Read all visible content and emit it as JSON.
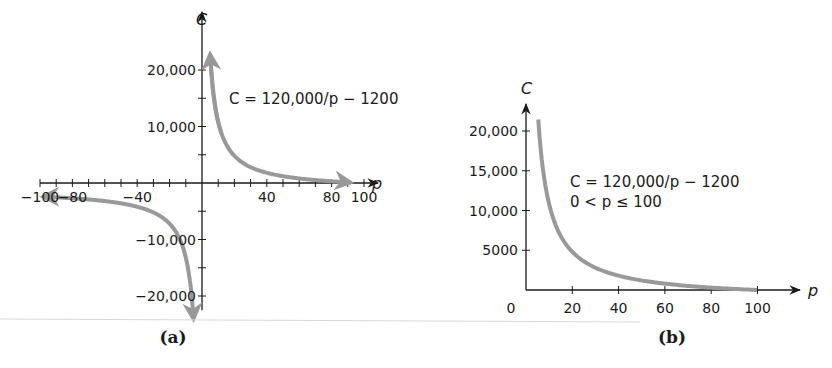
{
  "chart_data": [
    {
      "id": "a",
      "type": "line",
      "caption": "(a)",
      "title": "",
      "equation_label": "C = 120,000/p − 1200",
      "xlabel": "p",
      "ylabel": "C",
      "xlim": [
        -100,
        100
      ],
      "ylim": [
        -20000,
        20000
      ],
      "x_tick_labels": [
        "−100",
        "−80",
        "−40",
        "40",
        "80",
        "100"
      ],
      "x_tick_values": [
        -100,
        -80,
        -40,
        40,
        80,
        100
      ],
      "x_minor_ticks": [
        -100,
        -90,
        -80,
        -70,
        -60,
        -50,
        -40,
        -30,
        -20,
        -10,
        10,
        20,
        30,
        40,
        50,
        60,
        70,
        80,
        90,
        100
      ],
      "y_tick_labels": [
        "20,000",
        "10,000",
        "−10,000",
        "−20,000"
      ],
      "y_tick_values": [
        20000,
        10000,
        -10000,
        -20000
      ],
      "y_minor_ticks": [
        20000,
        15000,
        10000,
        5000,
        -5000,
        -10000,
        -15000,
        -20000
      ],
      "grid": false,
      "series": [
        {
          "name": "C = 120,000/p − 1200 (p > 0)",
          "color": "#999999",
          "x": [
            5,
            6,
            8,
            10,
            15,
            20,
            30,
            40,
            60,
            80,
            100
          ],
          "values": [
            22800,
            18800,
            13800,
            10800,
            6800,
            4800,
            2800,
            1800,
            800,
            300,
            0
          ]
        },
        {
          "name": "C = 120,000/p − 1200 (p < 0)",
          "color": "#999999",
          "x": [
            -100,
            -80,
            -60,
            -40,
            -30,
            -20,
            -15,
            -10,
            -8,
            -6,
            -5
          ],
          "values": [
            -2400,
            -2700,
            -3200,
            -4200,
            -5200,
            -7200,
            -9200,
            -13200,
            -16200,
            -21200,
            -25200
          ]
        }
      ]
    },
    {
      "id": "b",
      "type": "line",
      "caption": "(b)",
      "title": "",
      "equation_label": "C = 120,000/p − 1200",
      "domain_label": "0 < p ≤ 100",
      "xlabel": "p",
      "ylabel": "C",
      "xlim": [
        0,
        100
      ],
      "ylim": [
        0,
        20000
      ],
      "x_tick_labels": [
        "0",
        "20",
        "40",
        "60",
        "80",
        "100"
      ],
      "x_tick_values": [
        0,
        20,
        40,
        60,
        80,
        100
      ],
      "y_tick_labels": [
        "20,000",
        "15,000",
        "10,000",
        "5000"
      ],
      "y_tick_values": [
        20000,
        15000,
        10000,
        5000
      ],
      "grid": false,
      "series": [
        {
          "name": "C = 120,000/p − 1200",
          "color": "#999999",
          "x": [
            5.3,
            6,
            8,
            10,
            15,
            20,
            30,
            40,
            60,
            80,
            100
          ],
          "values": [
            21400,
            18800,
            13800,
            10800,
            6800,
            4800,
            2800,
            1800,
            800,
            300,
            0
          ]
        }
      ]
    }
  ],
  "figure": {
    "caption_a": "(a)",
    "caption_b": "(b)",
    "curve_color": "#999999",
    "axis_color": "#1a1a1a"
  }
}
